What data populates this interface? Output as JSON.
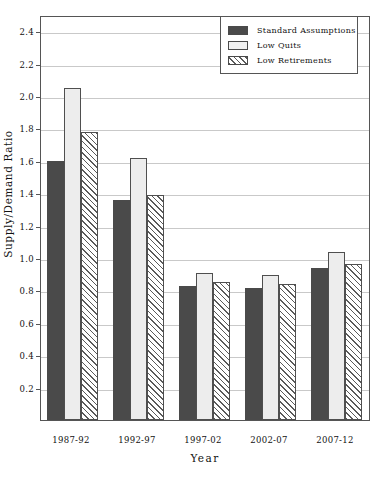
{
  "chart_data": {
    "type": "bar",
    "title": "",
    "xlabel": "Year",
    "ylabel": "Supply/Demand Ratio",
    "categories": [
      "1987-92",
      "1992-97",
      "1997-02",
      "2002-07",
      "2007-12"
    ],
    "series": [
      {
        "name": "Standard Assumptions",
        "values": [
          1.6,
          1.36,
          0.83,
          0.815,
          0.94
        ],
        "color": "#4a4a4a",
        "pattern": "solid-dark"
      },
      {
        "name": "Low Quits",
        "values": [
          2.05,
          1.62,
          0.905,
          0.895,
          1.04
        ],
        "color": "#ededed",
        "pattern": "light-dotted"
      },
      {
        "name": "Low Retirements",
        "values": [
          1.78,
          1.39,
          0.85,
          0.84,
          0.96
        ],
        "color": "#ffffff",
        "pattern": "diagonal-hatch"
      }
    ],
    "ylim": [
      0.0,
      2.5
    ],
    "y_ticks": [
      "0.2",
      "0.4",
      "0.6",
      "0.8",
      "1.0",
      "1.2",
      "1.4",
      "1.6",
      "1.8",
      "2.0",
      "2.2",
      "2.4"
    ],
    "y_tick_values": [
      0.2,
      0.4,
      0.6,
      0.8,
      1.0,
      1.2,
      1.4,
      1.6,
      1.8,
      2.0,
      2.2,
      2.4
    ],
    "grid": true,
    "legend_position": "top-right"
  },
  "axes": {
    "y_title": "Supply/Demand Ratio",
    "x_title": "Year"
  },
  "legend": {
    "entries": [
      {
        "label": "Standard Assumptions"
      },
      {
        "label": "Low Quits"
      },
      {
        "label": "Low Retirements"
      }
    ]
  }
}
